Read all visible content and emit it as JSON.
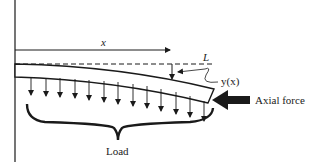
{
  "diagram": {
    "labels": {
      "x": "x",
      "L": "L",
      "y": "y(x)",
      "axial_force": "Axial force",
      "load": "Load"
    },
    "colors": {
      "stroke": "#1a1a1a",
      "background": "#ffffff"
    },
    "load_arrow_count": 13
  }
}
